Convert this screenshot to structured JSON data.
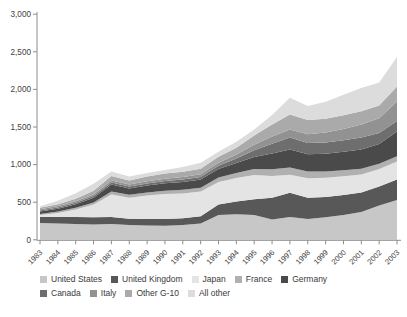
{
  "figure": {
    "background": "#ffffff",
    "axis_color": "#8c8c8c",
    "tick_label_color": "#404040"
  },
  "chart_data": {
    "type": "area",
    "stacked": true,
    "title": "",
    "xlabel": "",
    "ylabel": "",
    "grid": false,
    "legend_position": "bottom",
    "legend_rows": [
      5,
      4
    ],
    "ylim": [
      0,
      3000
    ],
    "yticks": [
      0,
      500,
      1000,
      1500,
      2000,
      2500,
      3000
    ],
    "ytick_labels": [
      "0",
      "500",
      "1,000",
      "1,500",
      "2,000",
      "2,500",
      "3,000"
    ],
    "x": [
      1983,
      1984,
      1985,
      1986,
      1987,
      1988,
      1989,
      1990,
      1991,
      1992,
      1993,
      1994,
      1995,
      1996,
      1997,
      1998,
      1999,
      2000,
      2001,
      2002,
      2003
    ],
    "x_labels": [
      "1983",
      "1984",
      "1985",
      "1986",
      "1987",
      "1988",
      "1989",
      "1990",
      "1991",
      "1992",
      "1993",
      "1994",
      "1995",
      "1996",
      "1997",
      "1998",
      "1999",
      "2000",
      "2001",
      "2002",
      "2003"
    ],
    "series": [
      {
        "name": "United States",
        "color": "#c7c7c7",
        "values": [
          225,
          218,
          212,
          205,
          212,
          195,
          190,
          188,
          195,
          218,
          330,
          340,
          330,
          268,
          305,
          278,
          300,
          330,
          370,
          455,
          530
        ]
      },
      {
        "name": "United Kingdom",
        "color": "#585858",
        "values": [
          80,
          85,
          92,
          95,
          92,
          85,
          88,
          90,
          92,
          95,
          140,
          170,
          210,
          290,
          320,
          280,
          270,
          265,
          260,
          255,
          270
        ]
      },
      {
        "name": "Japan",
        "color": "#e4e4e4",
        "values": [
          25,
          55,
          100,
          170,
          300,
          280,
          310,
          330,
          330,
          330,
          300,
          310,
          320,
          290,
          240,
          260,
          255,
          250,
          240,
          230,
          240
        ]
      },
      {
        "name": "France",
        "color": "#b0b0b0",
        "values": [
          15,
          18,
          22,
          28,
          40,
          38,
          42,
          45,
          48,
          50,
          60,
          70,
          80,
          90,
          95,
          90,
          85,
          80,
          75,
          72,
          70
        ]
      },
      {
        "name": "Germany",
        "color": "#4a4a4a",
        "values": [
          30,
          38,
          48,
          62,
          90,
          85,
          92,
          100,
          105,
          110,
          110,
          130,
          160,
          210,
          240,
          230,
          235,
          245,
          255,
          260,
          330
        ]
      },
      {
        "name": "Canada",
        "color": "#6e6e6e",
        "values": [
          15,
          17,
          19,
          22,
          26,
          25,
          27,
          29,
          31,
          33,
          45,
          60,
          90,
          130,
          160,
          150,
          150,
          155,
          160,
          150,
          140
        ]
      },
      {
        "name": "Italy",
        "color": "#929292",
        "values": [
          15,
          17,
          20,
          24,
          28,
          27,
          29,
          31,
          33,
          35,
          40,
          55,
          75,
          95,
          105,
          115,
          130,
          150,
          175,
          195,
          260
        ]
      },
      {
        "name": "Other G-10",
        "color": "#aaaaaa",
        "values": [
          20,
          26,
          34,
          46,
          62,
          55,
          62,
          67,
          71,
          74,
          80,
          90,
          120,
          160,
          200,
          190,
          185,
          180,
          175,
          170,
          200
        ]
      },
      {
        "name": "All other",
        "color": "#dcdcdc",
        "values": [
          20,
          46,
          73,
          93,
          60,
          50,
          50,
          50,
          65,
          80,
          65,
          80,
          80,
          127,
          225,
          187,
          225,
          275,
          310,
          303,
          390
        ]
      }
    ]
  }
}
